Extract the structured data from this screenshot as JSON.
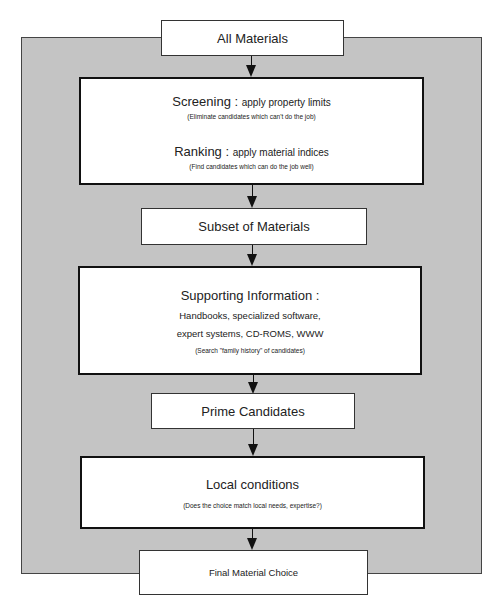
{
  "diagram": {
    "type": "flowchart",
    "colors": {
      "panel": "#c4c4c4",
      "box": "#ffffff",
      "stroke": "#111111"
    },
    "nodes": {
      "all_materials": {
        "label": "All Materials"
      },
      "screening_ranking": {
        "screening_title": "Screening",
        "screening_sep": " : ",
        "screening_action": "apply property limits",
        "screening_note": "(Eliminate candidates which can't do the job)",
        "ranking_title": "Ranking",
        "ranking_sep": " : ",
        "ranking_action": "apply material indices",
        "ranking_note": "(Find candidates which can do the job well)"
      },
      "subset": {
        "label": "Subset of Materials"
      },
      "supporting": {
        "title": "Supporting Information :",
        "line1": "Handbooks, specialized software,",
        "line2": "expert systems, CD-ROMS, WWW",
        "note": "(Search \"family history\" of candidates)"
      },
      "prime": {
        "label": "Prime Candidates"
      },
      "local": {
        "title": "Local conditions",
        "note": "(Does the choice match local needs, expertise?)"
      },
      "final": {
        "label": "Final Material Choice"
      }
    },
    "edges": [
      [
        "all_materials",
        "screening_ranking"
      ],
      [
        "screening_ranking",
        "subset"
      ],
      [
        "subset",
        "supporting"
      ],
      [
        "supporting",
        "prime"
      ],
      [
        "prime",
        "local"
      ],
      [
        "local",
        "final"
      ]
    ]
  }
}
